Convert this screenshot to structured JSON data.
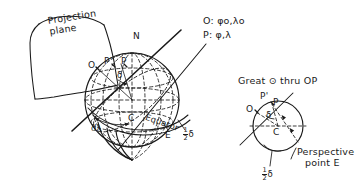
{
  "figure": {
    "title_hidden": "",
    "ink_color": "#1a1a1a",
    "background": "#ffffff",
    "style": "hand-drawn line art"
  },
  "left_diagram": {
    "name": "sphere-with-projection-plane",
    "plane_label_line1": "Projection",
    "plane_label_line2": "plane",
    "pole_north": "N",
    "point_O": "O",
    "point_P_prime": "P'",
    "point_P": "P",
    "center_C": "C",
    "angle_delta": "δ",
    "dlambda": "dλ",
    "equator": "Equator",
    "point_E": "E",
    "half_delta_num": "1",
    "half_delta_den": "2",
    "half_delta_sym": "δ"
  },
  "legend": {
    "rows": [
      {
        "point": "O",
        "sep": ":",
        "value": "φ",
        "sub1": "o",
        "comma": ",",
        "value2": "λ",
        "sub2": "o"
      },
      {
        "point": "P",
        "sep": ":",
        "value": "φ",
        "sub1": "",
        "comma": ",",
        "value2": "λ",
        "sub2": ""
      }
    ],
    "row0_text": "O: φo,λo",
    "row1_text": "P: φ,λ"
  },
  "right_diagram": {
    "name": "great-circle-thru-OP",
    "heading_pre": "Great",
    "heading_symbol": "⊙",
    "heading_post": "thru OP",
    "heading_full": "Great ⊙ thru OP",
    "point_P_prime": "P'",
    "point_P": "P",
    "point_O": "O",
    "center_C": "C",
    "angle_delta": "δ",
    "perspective_line1": "Perspective",
    "perspective_line2": "point E",
    "half_delta_num": "1",
    "half_delta_den": "2",
    "half_delta_sym": "δ"
  }
}
